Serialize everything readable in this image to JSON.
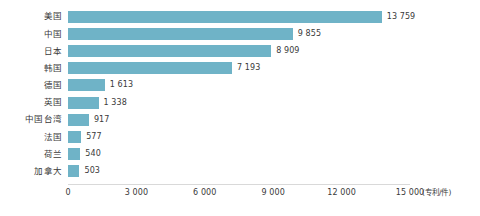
{
  "chart_data": {
    "type": "bar",
    "orientation": "horizontal",
    "title": "",
    "subtitle": "",
    "xlabel": "",
    "ylabel": "",
    "unit_label": "(专利/件)",
    "grid": false,
    "legend": "none",
    "xlim": [
      0,
      15000
    ],
    "categories": [
      "美国",
      "中国",
      "日本",
      "韩国",
      "德国",
      "英国",
      "中国台湾",
      "法国",
      "荷兰",
      "加拿大"
    ],
    "values": [
      13759,
      9855,
      8909,
      7193,
      1613,
      1338,
      917,
      577,
      540,
      503
    ],
    "value_labels": [
      "13 759",
      "9 855",
      "8 909",
      "7 193",
      "1 613",
      "1 338",
      "917",
      "577",
      "540",
      "503"
    ],
    "xticks": [
      0,
      3000,
      6000,
      9000,
      12000,
      15000
    ],
    "xtick_labels": [
      "0",
      "3 000",
      "6 000",
      "9 000",
      "12 000",
      "15 000"
    ],
    "bar_color": "#6fb3c7",
    "axis_color": "#d9d9d9",
    "text_color": "#3a3a3a",
    "background": "#ffffff"
  }
}
